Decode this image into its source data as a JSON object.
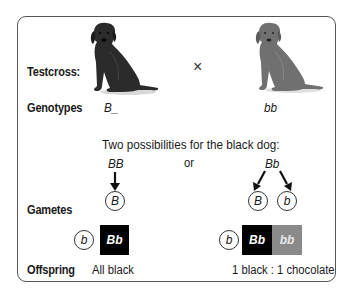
{
  "labels": {
    "testcross": "Testcross:",
    "genotypes": "Genotypes",
    "gametes": "Gametes",
    "offspring": "Offspring"
  },
  "parents": {
    "cross_symbol": "×",
    "black_dog": {
      "icon": "black-labrador-icon",
      "genotype": "B_"
    },
    "chocolate_dog": {
      "icon": "chocolate-labrador-icon",
      "genotype": "bb"
    }
  },
  "possibilities_heading": "Two possibilities for the black dog:",
  "or_label": "or",
  "case_homozygous": {
    "genotype": "BB",
    "gametes": [
      "B"
    ],
    "tester_gamete": "b",
    "offspring_cells": [
      {
        "genotype": "Bb",
        "color": "#000000"
      }
    ],
    "result": "All black"
  },
  "case_heterozygous": {
    "genotype": "Bb",
    "gametes": [
      "B",
      "b"
    ],
    "tester_gamete": "b",
    "offspring_cells": [
      {
        "genotype": "Bb",
        "color": "#000000"
      },
      {
        "genotype": "bb",
        "color": "#8a8a8a"
      }
    ],
    "result": "1 black : 1 chocolate"
  },
  "colors": {
    "border": "#555555",
    "black_cell": "#000000",
    "chocolate_cell": "#8a8a8a",
    "black_dog": "#2a2a2a",
    "chocolate_dog": "#6e6e6e"
  }
}
